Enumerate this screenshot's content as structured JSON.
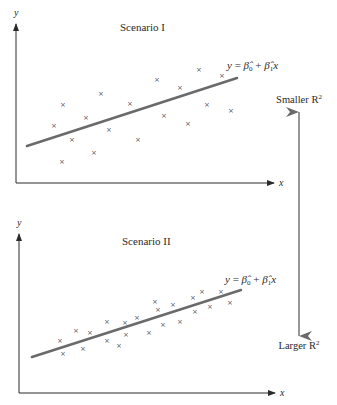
{
  "chart_data": [
    {
      "type": "scatter",
      "title": "Scenario I",
      "xlabel": "x",
      "ylabel": "y",
      "fit_label": "y = β̂0 + β̂1x",
      "fit_line": {
        "x1": 27,
        "y1": 146,
        "x2": 237,
        "y2": 78
      },
      "marker": "×",
      "points": [
        [
          199,
          69
        ],
        [
          222,
          75
        ],
        [
          157,
          79
        ],
        [
          180,
          87
        ],
        [
          101,
          93
        ],
        [
          63,
          104
        ],
        [
          130,
          103
        ],
        [
          207,
          104
        ],
        [
          231,
          110
        ],
        [
          86,
          117
        ],
        [
          164,
          115
        ],
        [
          54,
          125
        ],
        [
          109,
          129
        ],
        [
          188,
          123
        ],
        [
          72,
          139
        ],
        [
          138,
          139
        ],
        [
          94,
          152
        ],
        [
          62,
          161
        ]
      ],
      "axes": {
        "origin": [
          16,
          183
        ],
        "y_top": 24,
        "x_right": 274
      },
      "grid": false
    },
    {
      "type": "scatter",
      "title": "Scenario II",
      "xlabel": "x",
      "ylabel": "y",
      "fit_label": "y = β̂0 + β̂1x",
      "fit_line": {
        "x1": 32,
        "y1": 357,
        "x2": 241,
        "y2": 290
      },
      "marker": "×",
      "points": [
        [
          202,
          291
        ],
        [
          221,
          291
        ],
        [
          193,
          297
        ],
        [
          155,
          301
        ],
        [
          230,
          302
        ],
        [
          173,
          304
        ],
        [
          210,
          306
        ],
        [
          158,
          309
        ],
        [
          195,
          311
        ],
        [
          107,
          321
        ],
        [
          125,
          322
        ],
        [
          137,
          317
        ],
        [
          180,
          321
        ],
        [
          163,
          324
        ],
        [
          76,
          330
        ],
        [
          90,
          332
        ],
        [
          126,
          334
        ],
        [
          149,
          332
        ],
        [
          60,
          340
        ],
        [
          107,
          340
        ],
        [
          119,
          345
        ],
        [
          83,
          348
        ],
        [
          63,
          353
        ]
      ],
      "axes": {
        "origin": [
          19,
          393
        ],
        "y_top": 234,
        "x_right": 275
      },
      "grid": false
    }
  ],
  "annotations": {
    "top_label": "Smaller R",
    "bottom_label": "Larger R",
    "superscript": "2",
    "arrow": {
      "x": 299,
      "y_top": 112,
      "y_bottom": 336
    }
  },
  "colors": {
    "axis": "#2a2a2a",
    "fit_line": "#6a6a6a",
    "marker": "#555555",
    "arrow": "#6a6a6a"
  }
}
